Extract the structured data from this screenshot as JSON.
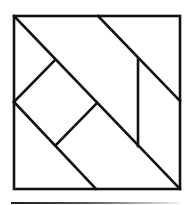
{
  "diagram": {
    "stroke_color": "#111111",
    "stroke_width": 2.6,
    "background": "#ffffff",
    "outer_square": {
      "x": 14,
      "y": 16,
      "width": 166,
      "height": 173
    },
    "lines": [
      {
        "id": "main-diagonal",
        "x1": 14,
        "y1": 16,
        "x2": 180,
        "y2": 189
      },
      {
        "id": "top-right-diagonal",
        "x1": 98,
        "y1": 16,
        "x2": 180,
        "y2": 101
      },
      {
        "id": "vertical-segment",
        "x1": 138,
        "y1": 59,
        "x2": 138,
        "y2": 146
      },
      {
        "id": "square-upper-left-edge",
        "x1": 14,
        "y1": 102,
        "x2": 55,
        "y2": 60
      },
      {
        "id": "square-lower-right-edge",
        "x1": 56,
        "y1": 145,
        "x2": 97,
        "y2": 103
      },
      {
        "id": "lower-left-diagonal",
        "x1": 14,
        "y1": 102,
        "x2": 96,
        "y2": 189
      }
    ],
    "underline": {
      "x": 11,
      "y": 202,
      "width": 169,
      "height": 2,
      "color_start": "#1a1a1a",
      "color_end": "#f0f0f0"
    }
  }
}
